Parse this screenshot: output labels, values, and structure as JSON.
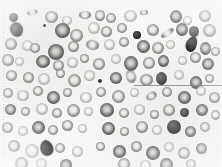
{
  "image": {
    "kind": "blood-smear-micrograph",
    "modality": "light-microscopy",
    "staining": "grayscale",
    "caption": "",
    "width_px": 222,
    "height_px": 167,
    "background_color": "#fbfbfa",
    "cell_rim_color": "#686866",
    "cell_pallor_color": "#f0f0ee",
    "dense_cell_color": "#34342f",
    "annotation_line_color": "#8a8a8a"
  },
  "annotations": {
    "margin_rule": {
      "label": "left-margin-dotted-rule",
      "x": 3,
      "y": 2,
      "length": 163,
      "orientation": "vertical",
      "style": "dotted"
    },
    "hairline": {
      "label": "horizontal-hairline",
      "x": 134,
      "y": 85,
      "length": 88,
      "orientation": "horizontal",
      "style": "solid"
    }
  },
  "legend": {
    "rbc_label": "erythrocyte",
    "spherocyte_label": "dense cell",
    "oval_label": "elongated cell",
    "speck_label": "platelet speck"
  },
  "cells": [
    {
      "x": 9,
      "y": 13,
      "w": 9,
      "h": 9,
      "t": "sphero",
      "r": 0,
      "b": "blur"
    },
    {
      "x": 27,
      "y": 10,
      "w": 11,
      "h": 5,
      "t": "oval-rbc",
      "r": -14,
      "b": "blur"
    },
    {
      "x": 45,
      "y": 11,
      "w": 13,
      "h": 12,
      "t": "rbc",
      "r": 0,
      "b": "blur"
    },
    {
      "x": 62,
      "y": 16,
      "w": 10,
      "h": 9,
      "t": "rbc pale",
      "r": 0,
      "b": "blur"
    },
    {
      "x": 79,
      "y": 11,
      "w": 12,
      "h": 8,
      "t": "rbc",
      "r": 0,
      "b": "blur"
    },
    {
      "x": 95,
      "y": 10,
      "w": 10,
      "h": 11,
      "t": "rbc",
      "r": 0,
      "b": "blur"
    },
    {
      "x": 106,
      "y": 13,
      "w": 10,
      "h": 10,
      "t": "rbc",
      "r": 0,
      "b": "blur"
    },
    {
      "x": 124,
      "y": 10,
      "w": 13,
      "h": 12,
      "t": "rbc pale",
      "r": 0,
      "b": "blur"
    },
    {
      "x": 140,
      "y": 10,
      "w": 8,
      "h": 5,
      "t": "oval-rbc",
      "r": -8,
      "b": "blur2"
    },
    {
      "x": 170,
      "y": 10,
      "w": 12,
      "h": 13,
      "t": "rbc deep",
      "r": 0,
      "b": "blur"
    },
    {
      "x": 183,
      "y": 16,
      "w": 9,
      "h": 9,
      "t": "rbc pale",
      "r": 0,
      "b": "blur"
    },
    {
      "x": 199,
      "y": 10,
      "w": 12,
      "h": 12,
      "t": "rbc",
      "r": 0,
      "b": "blur"
    },
    {
      "x": 10,
      "y": 22,
      "w": 13,
      "h": 15,
      "t": "sphero",
      "r": -20,
      "b": "blur"
    },
    {
      "x": 43,
      "y": 24,
      "w": 3,
      "h": 3,
      "t": "speck",
      "r": 0,
      "b": ""
    },
    {
      "x": 55,
      "y": 23,
      "w": 15,
      "h": 15,
      "t": "rbc deep",
      "r": 0,
      "b": "blur"
    },
    {
      "x": 70,
      "y": 29,
      "w": 13,
      "h": 13,
      "t": "rbc",
      "r": 0,
      "b": "blur"
    },
    {
      "x": 88,
      "y": 22,
      "w": 12,
      "h": 12,
      "t": "rbc pale",
      "r": 0,
      "b": "blur"
    },
    {
      "x": 101,
      "y": 26,
      "w": 11,
      "h": 11,
      "t": "rbc",
      "r": 0,
      "b": "blur"
    },
    {
      "x": 117,
      "y": 23,
      "w": 10,
      "h": 10,
      "t": "rbc",
      "r": 0,
      "b": "blur"
    },
    {
      "x": 133,
      "y": 31,
      "w": 8,
      "h": 8,
      "t": "sphero ink",
      "r": 0,
      "b": ""
    },
    {
      "x": 147,
      "y": 24,
      "w": 12,
      "h": 12,
      "t": "rbc",
      "r": 0,
      "b": "blur"
    },
    {
      "x": 160,
      "y": 30,
      "w": 15,
      "h": 6,
      "t": "oval-rbc",
      "r": -34,
      "b": "blur"
    },
    {
      "x": 176,
      "y": 23,
      "w": 12,
      "h": 13,
      "t": "rbc deep",
      "r": 0,
      "b": "blur"
    },
    {
      "x": 189,
      "y": 26,
      "w": 10,
      "h": 11,
      "t": "sphero",
      "r": 0,
      "b": ""
    },
    {
      "x": 203,
      "y": 24,
      "w": 13,
      "h": 13,
      "t": "rbc",
      "r": 0,
      "b": "blur"
    },
    {
      "x": 5,
      "y": 38,
      "w": 12,
      "h": 12,
      "t": "rbc",
      "r": 0,
      "b": "blur"
    },
    {
      "x": 22,
      "y": 40,
      "w": 11,
      "h": 11,
      "t": "rbc pale",
      "r": 0,
      "b": "blur"
    },
    {
      "x": 30,
      "y": 43,
      "w": 10,
      "h": 10,
      "t": "rbc",
      "r": 0,
      "b": "blur"
    },
    {
      "x": 48,
      "y": 44,
      "w": 16,
      "h": 16,
      "t": "rbc deep",
      "r": 0,
      "b": "blur"
    },
    {
      "x": 68,
      "y": 41,
      "w": 11,
      "h": 11,
      "t": "rbc",
      "r": 0,
      "b": "blur"
    },
    {
      "x": 86,
      "y": 40,
      "w": 13,
      "h": 10,
      "t": "oval-rbc",
      "r": 12,
      "b": "blur"
    },
    {
      "x": 104,
      "y": 39,
      "w": 11,
      "h": 11,
      "t": "rbc pale",
      "r": 0,
      "b": "blur"
    },
    {
      "x": 119,
      "y": 37,
      "w": 10,
      "h": 10,
      "t": "rbc",
      "r": 0,
      "b": "blur"
    },
    {
      "x": 137,
      "y": 40,
      "w": 13,
      "h": 13,
      "t": "rbc deep",
      "r": 0,
      "b": "blur"
    },
    {
      "x": 152,
      "y": 42,
      "w": 12,
      "h": 12,
      "t": "rbc",
      "r": 0,
      "b": "blur"
    },
    {
      "x": 166,
      "y": 40,
      "w": 9,
      "h": 9,
      "t": "rbc pale",
      "r": 0,
      "b": "blur"
    },
    {
      "x": 186,
      "y": 36,
      "w": 11,
      "h": 16,
      "t": "tear-dark",
      "r": 18,
      "b": ""
    },
    {
      "x": 200,
      "y": 42,
      "w": 11,
      "h": 13,
      "t": "rbc deep",
      "r": 0,
      "b": "blur"
    },
    {
      "x": 211,
      "y": 47,
      "w": 9,
      "h": 9,
      "t": "rbc",
      "r": 0,
      "b": "blur"
    },
    {
      "x": 2,
      "y": 54,
      "w": 12,
      "h": 12,
      "t": "rbc",
      "r": 0,
      "b": "blur"
    },
    {
      "x": 15,
      "y": 57,
      "w": 9,
      "h": 9,
      "t": "rbc pale",
      "r": 0,
      "b": "blur"
    },
    {
      "x": 36,
      "y": 55,
      "w": 14,
      "h": 13,
      "t": "rbc deep",
      "r": 0,
      "b": "blur"
    },
    {
      "x": 53,
      "y": 60,
      "w": 11,
      "h": 11,
      "t": "rbc",
      "r": 0,
      "b": "blur"
    },
    {
      "x": 67,
      "y": 57,
      "w": 11,
      "h": 11,
      "t": "rbc pale",
      "r": 0,
      "b": "blur"
    },
    {
      "x": 80,
      "y": 54,
      "w": 9,
      "h": 9,
      "t": "rbc",
      "r": 0,
      "b": "blur"
    },
    {
      "x": 93,
      "y": 58,
      "w": 12,
      "h": 12,
      "t": "rbc",
      "r": 0,
      "b": "blur"
    },
    {
      "x": 111,
      "y": 54,
      "w": 10,
      "h": 10,
      "t": "rbc pale",
      "r": 0,
      "b": "blur"
    },
    {
      "x": 124,
      "y": 56,
      "w": 14,
      "h": 15,
      "t": "rbc deep",
      "r": 0,
      "b": "blur"
    },
    {
      "x": 143,
      "y": 57,
      "w": 12,
      "h": 12,
      "t": "rbc",
      "r": 0,
      "b": "blur"
    },
    {
      "x": 158,
      "y": 55,
      "w": 11,
      "h": 12,
      "t": "rbc deep",
      "r": 0,
      "b": "blur"
    },
    {
      "x": 178,
      "y": 56,
      "w": 9,
      "h": 9,
      "t": "rbc pale",
      "r": 0,
      "b": "blur"
    },
    {
      "x": 190,
      "y": 52,
      "w": 11,
      "h": 11,
      "t": "rbc",
      "r": 0,
      "b": "blur"
    },
    {
      "x": 202,
      "y": 58,
      "w": 12,
      "h": 12,
      "t": "rbc deep",
      "r": 0,
      "b": "blur"
    },
    {
      "x": 6,
      "y": 70,
      "w": 11,
      "h": 11,
      "t": "rbc",
      "r": 0,
      "b": "blur"
    },
    {
      "x": 23,
      "y": 72,
      "w": 11,
      "h": 11,
      "t": "rbc",
      "r": 0,
      "b": "blur"
    },
    {
      "x": 38,
      "y": 73,
      "w": 12,
      "h": 12,
      "t": "rbc pale",
      "r": 0,
      "b": "blur"
    },
    {
      "x": 56,
      "y": 69,
      "w": 9,
      "h": 9,
      "t": "rbc",
      "r": 0,
      "b": "blur"
    },
    {
      "x": 68,
      "y": 74,
      "w": 13,
      "h": 13,
      "t": "rbc",
      "r": 0,
      "b": "blur"
    },
    {
      "x": 84,
      "y": 70,
      "w": 11,
      "h": 11,
      "t": "rbc pale",
      "r": 0,
      "b": "blur"
    },
    {
      "x": 98,
      "y": 79,
      "w": 4,
      "h": 4,
      "t": "speck",
      "r": 0,
      "b": ""
    },
    {
      "x": 110,
      "y": 72,
      "w": 12,
      "h": 12,
      "t": "rbc deep",
      "r": 0,
      "b": "blur"
    },
    {
      "x": 126,
      "y": 70,
      "w": 10,
      "h": 13,
      "t": "oval-rbc",
      "r": -18,
      "b": "blur"
    },
    {
      "x": 140,
      "y": 74,
      "w": 13,
      "h": 12,
      "t": "rbc",
      "r": 0,
      "b": "blur"
    },
    {
      "x": 156,
      "y": 72,
      "w": 11,
      "h": 13,
      "t": "sphero",
      "r": 0,
      "b": "blur"
    },
    {
      "x": 174,
      "y": 70,
      "w": 10,
      "h": 10,
      "t": "rbc pale",
      "r": 0,
      "b": "blur"
    },
    {
      "x": 190,
      "y": 76,
      "w": 12,
      "h": 13,
      "t": "rbc deep",
      "r": 0,
      "b": "blur"
    },
    {
      "x": 205,
      "y": 74,
      "w": 9,
      "h": 9,
      "t": "rbc",
      "r": 0,
      "b": "blur"
    },
    {
      "x": 3,
      "y": 88,
      "w": 10,
      "h": 10,
      "t": "rbc",
      "r": 0,
      "b": "blur"
    },
    {
      "x": 17,
      "y": 90,
      "w": 12,
      "h": 11,
      "t": "rbc pale",
      "r": 0,
      "b": "blur"
    },
    {
      "x": 33,
      "y": 86,
      "w": 10,
      "h": 10,
      "t": "rbc",
      "r": 0,
      "b": "blur"
    },
    {
      "x": 47,
      "y": 91,
      "w": 13,
      "h": 13,
      "t": "rbc deep",
      "r": 0,
      "b": "blur"
    },
    {
      "x": 63,
      "y": 88,
      "w": 9,
      "h": 9,
      "t": "rbc",
      "r": 0,
      "b": "blur"
    },
    {
      "x": 80,
      "y": 92,
      "w": 12,
      "h": 11,
      "t": "rbc pale",
      "r": 0,
      "b": "blur"
    },
    {
      "x": 96,
      "y": 87,
      "w": 10,
      "h": 10,
      "t": "rbc",
      "r": 0,
      "b": "blur"
    },
    {
      "x": 112,
      "y": 90,
      "w": 13,
      "h": 13,
      "t": "rbc",
      "r": 0,
      "b": "blur"
    },
    {
      "x": 130,
      "y": 88,
      "w": 9,
      "h": 9,
      "t": "rbc pale",
      "r": 0,
      "b": "blur"
    },
    {
      "x": 146,
      "y": 92,
      "w": 11,
      "h": 8,
      "t": "oval-rbc",
      "r": -28,
      "b": "blur"
    },
    {
      "x": 162,
      "y": 87,
      "w": 10,
      "h": 10,
      "t": "rbc",
      "r": 0,
      "b": "blur"
    },
    {
      "x": 178,
      "y": 91,
      "w": 13,
      "h": 13,
      "t": "rbc deep",
      "r": 0,
      "b": "blur"
    },
    {
      "x": 196,
      "y": 86,
      "w": 10,
      "h": 10,
      "t": "rbc pale",
      "r": 0,
      "b": "blur"
    },
    {
      "x": 209,
      "y": 92,
      "w": 11,
      "h": 11,
      "t": "rbc",
      "r": 0,
      "b": "blur"
    },
    {
      "x": 5,
      "y": 104,
      "w": 11,
      "h": 11,
      "t": "rbc deep",
      "r": 0,
      "b": "blur"
    },
    {
      "x": 21,
      "y": 107,
      "w": 9,
      "h": 9,
      "t": "rbc",
      "r": 0,
      "b": "blur"
    },
    {
      "x": 36,
      "y": 103,
      "w": 12,
      "h": 12,
      "t": "rbc pale",
      "r": 0,
      "b": "blur"
    },
    {
      "x": 52,
      "y": 108,
      "w": 10,
      "h": 10,
      "t": "rbc",
      "r": 0,
      "b": "blur"
    },
    {
      "x": 67,
      "y": 104,
      "w": 13,
      "h": 13,
      "t": "rbc",
      "r": 0,
      "b": "blur"
    },
    {
      "x": 84,
      "y": 107,
      "w": 9,
      "h": 9,
      "t": "rbc pale",
      "r": 0,
      "b": "blur"
    },
    {
      "x": 100,
      "y": 103,
      "w": 14,
      "h": 14,
      "t": "rbc deep",
      "r": 0,
      "b": "blur"
    },
    {
      "x": 119,
      "y": 108,
      "w": 10,
      "h": 10,
      "t": "rbc",
      "r": 0,
      "b": "blur"
    },
    {
      "x": 134,
      "y": 104,
      "w": 11,
      "h": 11,
      "t": "rbc pale",
      "r": 0,
      "b": "blur"
    },
    {
      "x": 150,
      "y": 110,
      "w": 9,
      "h": 9,
      "t": "rbc",
      "r": 0,
      "b": "blur"
    },
    {
      "x": 163,
      "y": 104,
      "w": 12,
      "h": 12,
      "t": "rbc",
      "r": 0,
      "b": "blur"
    },
    {
      "x": 180,
      "y": 108,
      "w": 9,
      "h": 9,
      "t": "sphero",
      "r": 0,
      "b": ""
    },
    {
      "x": 196,
      "y": 104,
      "w": 12,
      "h": 12,
      "t": "rbc deep",
      "r": 0,
      "b": "blur"
    },
    {
      "x": 211,
      "y": 110,
      "w": 9,
      "h": 10,
      "t": "rbc",
      "r": 0,
      "b": "blur"
    },
    {
      "x": 2,
      "y": 122,
      "w": 11,
      "h": 11,
      "t": "rbc",
      "r": 0,
      "b": "blur"
    },
    {
      "x": 18,
      "y": 126,
      "w": 10,
      "h": 10,
      "t": "rbc pale",
      "r": 0,
      "b": "blur"
    },
    {
      "x": 32,
      "y": 121,
      "w": 13,
      "h": 13,
      "t": "rbc deep",
      "r": 0,
      "b": "blur"
    },
    {
      "x": 48,
      "y": 125,
      "w": 10,
      "h": 10,
      "t": "rbc",
      "r": 0,
      "b": "blur"
    },
    {
      "x": 62,
      "y": 120,
      "w": 11,
      "h": 11,
      "t": "rbc",
      "r": 0,
      "b": "blur"
    },
    {
      "x": 78,
      "y": 124,
      "w": 9,
      "h": 9,
      "t": "rbc pale",
      "r": 0,
      "b": "blur"
    },
    {
      "x": 102,
      "y": 122,
      "w": 13,
      "h": 13,
      "t": "rbc deep",
      "r": 0,
      "b": "blur"
    },
    {
      "x": 120,
      "y": 127,
      "w": 9,
      "h": 9,
      "t": "rbc",
      "r": 0,
      "b": "blur"
    },
    {
      "x": 136,
      "y": 121,
      "w": 12,
      "h": 12,
      "t": "rbc",
      "r": 0,
      "b": "blur"
    },
    {
      "x": 152,
      "y": 125,
      "w": 10,
      "h": 10,
      "t": "rbc pale",
      "r": 0,
      "b": "blur"
    },
    {
      "x": 167,
      "y": 120,
      "w": 14,
      "h": 14,
      "t": "sphero",
      "r": 0,
      "b": "blur"
    },
    {
      "x": 185,
      "y": 126,
      "w": 11,
      "h": 11,
      "t": "rbc deep",
      "r": 0,
      "b": "blur"
    },
    {
      "x": 200,
      "y": 122,
      "w": 10,
      "h": 10,
      "t": "rbc",
      "r": 0,
      "b": "blur"
    },
    {
      "x": 8,
      "y": 140,
      "w": 12,
      "h": 12,
      "t": "rbc",
      "r": 0,
      "b": "blur"
    },
    {
      "x": 25,
      "y": 144,
      "w": 14,
      "h": 14,
      "t": "rbc pale",
      "r": 0,
      "b": "blur"
    },
    {
      "x": 40,
      "y": 140,
      "w": 13,
      "h": 16,
      "t": "tear-dark",
      "r": -22,
      "b": "blur"
    },
    {
      "x": 55,
      "y": 143,
      "w": 10,
      "h": 10,
      "t": "rbc",
      "r": 0,
      "b": "blur"
    },
    {
      "x": 72,
      "y": 146,
      "w": 11,
      "h": 11,
      "t": "rbc pale",
      "r": 0,
      "b": "blur"
    },
    {
      "x": 96,
      "y": 142,
      "w": 9,
      "h": 9,
      "t": "rbc",
      "r": 0,
      "b": "blur2"
    },
    {
      "x": 113,
      "y": 145,
      "w": 13,
      "h": 13,
      "t": "rbc deep",
      "r": 0,
      "b": "blur"
    },
    {
      "x": 131,
      "y": 141,
      "w": 11,
      "h": 11,
      "t": "rbc",
      "r": 0,
      "b": "blur"
    },
    {
      "x": 146,
      "y": 146,
      "w": 14,
      "h": 14,
      "t": "rbc deep",
      "r": 0,
      "b": "blur"
    },
    {
      "x": 164,
      "y": 142,
      "w": 10,
      "h": 10,
      "t": "rbc pale",
      "r": 0,
      "b": "blur"
    },
    {
      "x": 178,
      "y": 147,
      "w": 12,
      "h": 12,
      "t": "rbc",
      "r": 0,
      "b": "blur"
    },
    {
      "x": 196,
      "y": 143,
      "w": 11,
      "h": 11,
      "t": "rbc deep",
      "r": 0,
      "b": "blur"
    },
    {
      "x": 15,
      "y": 157,
      "w": 13,
      "h": 13,
      "t": "rbc",
      "r": 0,
      "b": "blur"
    },
    {
      "x": 36,
      "y": 158,
      "w": 11,
      "h": 11,
      "t": "rbc pale",
      "r": 0,
      "b": "blur"
    },
    {
      "x": 60,
      "y": 159,
      "w": 12,
      "h": 12,
      "t": "rbc deep",
      "r": 0,
      "b": "blur"
    },
    {
      "x": 118,
      "y": 158,
      "w": 12,
      "h": 12,
      "t": "rbc",
      "r": 0,
      "b": "blur"
    },
    {
      "x": 140,
      "y": 160,
      "w": 11,
      "h": 11,
      "t": "rbc pale",
      "r": 0,
      "b": "blur"
    },
    {
      "x": 160,
      "y": 158,
      "w": 13,
      "h": 13,
      "t": "rbc deep",
      "r": 0,
      "b": "blur"
    },
    {
      "x": 186,
      "y": 159,
      "w": 10,
      "h": 10,
      "t": "rbc",
      "r": 0,
      "b": "blur"
    }
  ]
}
